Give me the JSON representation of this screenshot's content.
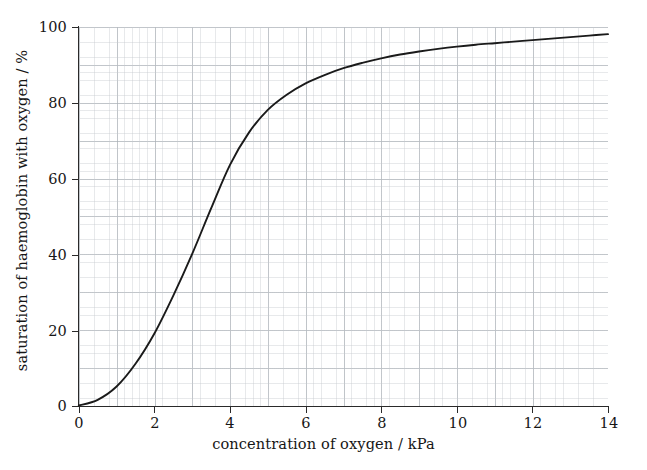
{
  "chart_data": {
    "type": "line",
    "title": "",
    "xlabel": "concentration of oxygen / kPa",
    "ylabel": "saturation of haemoglobin with oxygen / %",
    "xlim": [
      0,
      14
    ],
    "ylim": [
      0,
      100
    ],
    "grid": true,
    "legend": "none",
    "xticks": [
      0,
      2,
      4,
      6,
      8,
      10,
      12,
      14
    ],
    "xtick_labels": [
      "0",
      "2",
      "4",
      "6",
      "8",
      "10",
      "12",
      "14"
    ],
    "yticks": [
      0,
      20,
      40,
      60,
      80,
      100
    ],
    "ytick_labels": [
      "0",
      "20",
      "40",
      "60",
      "80",
      "100"
    ],
    "series": [
      {
        "name": "oxygen dissociation curve",
        "color": "#1a1a1a",
        "x": [
          0,
          0.5,
          1.0,
          1.5,
          2.0,
          2.5,
          3.0,
          3.5,
          4.0,
          4.5,
          5.0,
          5.5,
          6.0,
          6.5,
          7.0,
          7.5,
          8.0,
          8.5,
          9.0,
          9.5,
          10.0,
          10.5,
          11.0,
          11.5,
          12.0,
          12.5,
          13.0,
          13.5,
          14.0
        ],
        "y": [
          0,
          1.5,
          5.0,
          11.0,
          19.0,
          29.0,
          40.0,
          52.0,
          63.5,
          72.0,
          78.0,
          82.0,
          85.0,
          87.2,
          89.0,
          90.4,
          91.6,
          92.6,
          93.4,
          94.1,
          94.7,
          95.2,
          95.6,
          96.0,
          96.4,
          96.8,
          97.2,
          97.6,
          98.0
        ]
      }
    ]
  },
  "axes": {
    "x_title": "concentration of oxygen / kPa",
    "y_title": "saturation of haemoglobin with oxygen / %",
    "x_ticks": [
      "0",
      "2",
      "4",
      "6",
      "8",
      "10",
      "12",
      "14"
    ],
    "y_ticks": [
      "0",
      "20",
      "40",
      "60",
      "80",
      "100"
    ]
  },
  "style": {
    "axis_color": "#2a2a2a",
    "curve_color": "#1a1a1a",
    "grid_minor_color": "#c4c8cd",
    "grid_major_color": "#a8aeb4",
    "background": "#ffffff"
  }
}
